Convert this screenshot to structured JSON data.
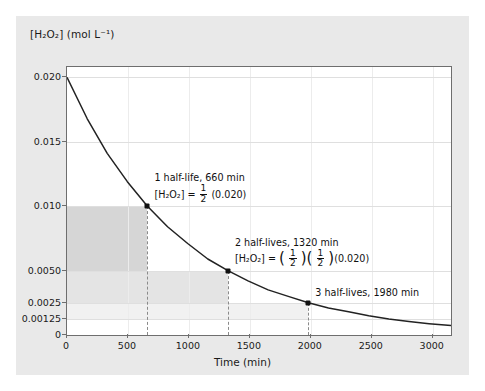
{
  "chart_data": {
    "type": "line",
    "title": "",
    "xlabel": "Time (min)",
    "ylabel": "[H2O2] (mol L^-1)",
    "ylabel_display": "[H₂O₂] (mol L⁻¹)",
    "xlim": [
      0,
      3150
    ],
    "ylim": [
      0,
      0.0208
    ],
    "x_ticks": [
      0,
      500,
      1000,
      1500,
      2000,
      2500,
      3000
    ],
    "x_tick_labels": [
      "0",
      "500",
      "1000",
      "1500",
      "2000",
      "2500",
      "3000"
    ],
    "y_ticks": [
      0,
      0.00125,
      0.0025,
      0.005,
      0.01,
      0.015,
      0.02
    ],
    "y_tick_labels": [
      "0",
      "0.00125",
      "0.0025",
      "0.0050",
      "0.010",
      "0.015",
      "0.020"
    ],
    "grid": true,
    "legend": "none",
    "curve_description": "first-order exponential decay of hydrogen peroxide",
    "initial_concentration": 0.02,
    "half_life_min": 660,
    "series": [
      {
        "name": "[H2O2] vs time",
        "x": [
          0,
          165,
          330,
          495,
          660,
          825,
          990,
          1155,
          1320,
          1485,
          1650,
          1815,
          1980,
          2145,
          2310,
          2475,
          2640,
          2805,
          2970,
          3150
        ],
        "y": [
          0.02,
          0.0168,
          0.0141,
          0.0119,
          0.01,
          0.0084,
          0.0071,
          0.0059,
          0.005,
          0.0042,
          0.0035,
          0.003,
          0.0025,
          0.0021,
          0.0018,
          0.0015,
          0.00125,
          0.00105,
          0.00088,
          0.00073
        ]
      }
    ],
    "markers": [
      {
        "x": 660,
        "y": 0.01,
        "label": "1 half-life, 660 min"
      },
      {
        "x": 1320,
        "y": 0.005,
        "label": "2 half-lives, 1320 min"
      },
      {
        "x": 1980,
        "y": 0.0025,
        "label": "3 half-lives, 1980 min"
      }
    ],
    "shaded_bands": [
      {
        "x_end": 660,
        "y_top": 0.01,
        "y_bottom": 0.005,
        "color": "#d6d6d6"
      },
      {
        "x_end": 1320,
        "y_top": 0.005,
        "y_bottom": 0.0025,
        "color": "#e4e4e4"
      },
      {
        "x_end": 1980,
        "y_top": 0.0025,
        "y_bottom": 0.00125,
        "color": "#f1f1f1"
      }
    ]
  },
  "annotations": {
    "one": {
      "line1": "1 half-life, 660 min",
      "species": "[H₂O₂]",
      "equals": "=",
      "frac_num": "1",
      "frac_den": "2",
      "value": "(0.020)"
    },
    "two": {
      "line1": "2 half-lives, 1320 min",
      "species": "[H₂O₂]",
      "equals": "=",
      "frac_num": "1",
      "frac_den": "2",
      "frac2_num": "1",
      "frac2_den": "2",
      "value": "(0.020)"
    },
    "three": {
      "line1": "3 half-lives, 1980 min"
    }
  },
  "colors": {
    "figure_background": "#e9e9e9",
    "plot_background": "#ffffff",
    "axis": "#6e6e6e",
    "curve": "#222222",
    "dash": "#8a8a8a",
    "text": "#111111"
  }
}
